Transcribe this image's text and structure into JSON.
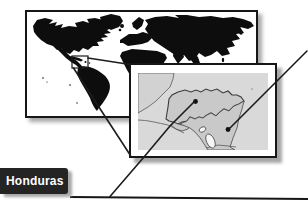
{
  "label": {
    "text": "Honduras"
  },
  "colors": {
    "label_bg": "#242424",
    "label_text": "#ffffff",
    "box_border": "#161616",
    "shadow": "#a6a6a6",
    "line": "#1c1c1c",
    "world_land": "#0d0d0d",
    "world_sea": "#ffffff",
    "inset_sea": "#d9d9d9",
    "inset_land": "#c9c9c9",
    "inset_land_light": "#d2d2d2",
    "inset_outline": "#4a4a4a",
    "lake": "#f5f5f5",
    "marker": "#111111"
  },
  "maps": {
    "world": {
      "name": "world-locator-map",
      "highlight_region": "Central America"
    },
    "inset": {
      "name": "central-america-inset-map",
      "markers": [
        {
          "name": "honduras-marker"
        },
        {
          "name": "nicaragua-marker"
        }
      ]
    }
  }
}
